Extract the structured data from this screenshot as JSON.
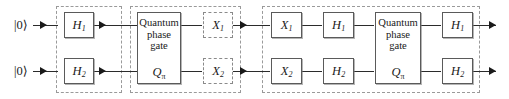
{
  "diagram": {
    "colors": {
      "wire": "#2b2b2b",
      "gate_border": "#5a5a5a",
      "dashed_border": "#9a9a9a",
      "text": "#1a1a1a",
      "background": "#ffffff"
    },
    "inputs": [
      {
        "name": "qubit-1-input",
        "label": "|0⟩"
      },
      {
        "name": "qubit-2-input",
        "label": "|0⟩"
      }
    ],
    "groups": [
      {
        "name": "group-hadamard-prep",
        "style": "dashed"
      },
      {
        "name": "group-phase-and-x",
        "style": "dashed"
      },
      {
        "name": "group-oracle-diffusion",
        "style": "dashed"
      }
    ],
    "gates": {
      "h1_prep": {
        "symbol": "H",
        "sub": "1",
        "style": "solid"
      },
      "h2_prep": {
        "symbol": "H",
        "sub": "2",
        "style": "solid"
      },
      "x1_dashed": {
        "symbol": "X",
        "sub": "1",
        "style": "dashed"
      },
      "x2_dashed": {
        "symbol": "X",
        "sub": "2",
        "style": "dashed"
      },
      "x1_solid": {
        "symbol": "X",
        "sub": "1",
        "style": "solid"
      },
      "x2_solid": {
        "symbol": "X",
        "sub": "2",
        "style": "solid"
      },
      "h1_mid": {
        "symbol": "H",
        "sub": "1",
        "style": "solid"
      },
      "h2_mid": {
        "symbol": "H",
        "sub": "2",
        "style": "solid"
      },
      "h1_out": {
        "symbol": "H",
        "sub": "1",
        "style": "solid"
      },
      "h2_out": {
        "symbol": "H",
        "sub": "2",
        "style": "solid"
      }
    },
    "phase_gates": [
      {
        "name": "quantum-phase-gate-1",
        "line1": "Quantum",
        "line2": "phase",
        "line3": "gate",
        "symbol": "Q",
        "sub": "π"
      },
      {
        "name": "quantum-phase-gate-2",
        "line1": "Quantum",
        "line2": "phase",
        "line3": "gate",
        "symbol": "Q",
        "sub": "π"
      }
    ]
  }
}
